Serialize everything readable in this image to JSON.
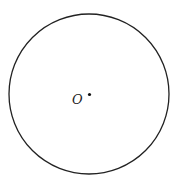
{
  "diagram": {
    "type": "geometry",
    "shapes": [
      {
        "kind": "circle",
        "name": "circle-O",
        "cx": 89,
        "cy": 94,
        "r": 80,
        "stroke": "#222222",
        "stroke_width": 1.3
      }
    ],
    "points": [
      {
        "name": "center-O",
        "label": "O",
        "x": 89,
        "y": 94
      }
    ]
  }
}
